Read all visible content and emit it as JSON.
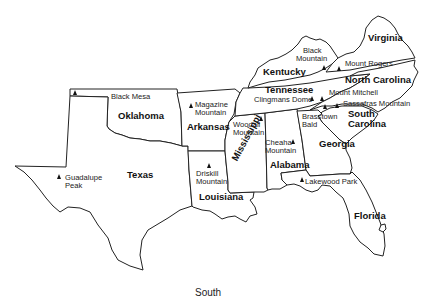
{
  "map": {
    "caption": "South",
    "states": [
      {
        "id": "texas",
        "name": "Texas"
      },
      {
        "id": "oklahoma",
        "name": "Oklahoma"
      },
      {
        "id": "arkansas",
        "name": "Arkansas"
      },
      {
        "id": "louisiana",
        "name": "Louisiana"
      },
      {
        "id": "mississippi",
        "name": "Mississippi"
      },
      {
        "id": "alabama",
        "name": "Alabama"
      },
      {
        "id": "tennessee",
        "name": "Tennessee"
      },
      {
        "id": "kentucky",
        "name": "Kentucky"
      },
      {
        "id": "georgia",
        "name": "Georgia"
      },
      {
        "id": "florida",
        "name": "Florida"
      },
      {
        "id": "south-carolina",
        "name": "South Carolina",
        "line1": "South",
        "line2": "Carolina"
      },
      {
        "id": "north-carolina",
        "name": "North Carolina"
      },
      {
        "id": "virginia",
        "name": "Virginia"
      }
    ],
    "peaks": [
      {
        "id": "black-mesa",
        "name": "Black Mesa",
        "state": "Oklahoma"
      },
      {
        "id": "guadalupe-peak",
        "name": "Guadalupe Peak",
        "line1": "Guadalupe",
        "line2": "Peak",
        "state": "Texas"
      },
      {
        "id": "magazine-mountain",
        "name": "Magazine Mountain",
        "line1": "Magazine",
        "line2": "Mountain",
        "state": "Arkansas"
      },
      {
        "id": "driskill-mountain",
        "name": "Driskill Mountain",
        "line1": "Driskill",
        "line2": "Mountain",
        "state": "Louisiana"
      },
      {
        "id": "woodall-mountain",
        "name": "Woodall Mountain",
        "line1": "Woodall",
        "line2": "Mountain",
        "state": "Mississippi"
      },
      {
        "id": "cheaha-mountain",
        "name": "Cheaha Mountain",
        "line1": "Cheaha",
        "line2": "Mountain",
        "state": "Alabama"
      },
      {
        "id": "clingmans-dome",
        "name": "Clingmans Dome",
        "state": "Tennessee"
      },
      {
        "id": "black-mountain",
        "name": "Black Mountain",
        "line1": "Black",
        "line2": "Mountain",
        "state": "Kentucky"
      },
      {
        "id": "brasstown-bald",
        "name": "Brasstown Bald",
        "line1": "Brasstown",
        "line2": "Bald",
        "state": "Georgia"
      },
      {
        "id": "lakewood-park",
        "name": "Lakewood Park",
        "state": "Florida"
      },
      {
        "id": "sassafras-mountain",
        "name": "Sassafras Mountain",
        "state": "South Carolina"
      },
      {
        "id": "mount-mitchell",
        "name": "Mount Mitchell",
        "state": "North Carolina"
      },
      {
        "id": "mount-rogers",
        "name": "Mount Rogers",
        "state": "Virginia"
      }
    ],
    "colors": {
      "line": "#222222",
      "fill": "#ffffff",
      "text": "#111111"
    }
  }
}
